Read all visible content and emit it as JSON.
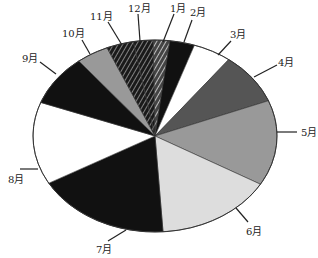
{
  "chart_data": {
    "type": "pie",
    "title": "",
    "legend": "none",
    "categories": [
      "1月",
      "2月",
      "3月",
      "4月",
      "5月",
      "6月",
      "7月",
      "8月",
      "9月",
      "10月",
      "11月",
      "12月"
    ],
    "values": [
      2.2,
      3.3,
      5.1,
      8.7,
      14.4,
      15.6,
      17.9,
      13.9,
      8.6,
      4.3,
      3.6,
      2.6
    ],
    "unit": "%",
    "start_angle_deg": -90.9,
    "direction": "clockwise",
    "fills": [
      "hatch-light",
      "#111111",
      "#ffffff",
      "#555555",
      "#999999",
      "#dddddd",
      "#111111",
      "#ffffff",
      "#111111",
      "#999999",
      "hatch-dark",
      "hatch-dark"
    ]
  },
  "geometry": {
    "cx": 155,
    "cy": 136,
    "rx": 122,
    "ry": 96
  },
  "labels": [
    {
      "text": "1月",
      "x": 170,
      "y": 12,
      "lx1": 174,
      "ly1": 14,
      "lx2": 163,
      "ly2": 42
    },
    {
      "text": "2月",
      "x": 190,
      "y": 16,
      "lx1": 192,
      "ly1": 20,
      "lx2": 184,
      "ly2": 42
    },
    {
      "text": "3月",
      "x": 230,
      "y": 38,
      "lx1": 231,
      "ly1": 41,
      "lx2": 218,
      "ly2": 55
    },
    {
      "text": "4月",
      "x": 278,
      "y": 66,
      "lx1": 277,
      "ly1": 65,
      "lx2": 254,
      "ly2": 77
    },
    {
      "text": "5月",
      "x": 301,
      "y": 136,
      "lx1": 297,
      "ly1": 132,
      "lx2": 277,
      "ly2": 132
    },
    {
      "text": "6月",
      "x": 246,
      "y": 235,
      "lx1": 248,
      "ly1": 222,
      "lx2": 236,
      "ly2": 208
    },
    {
      "text": "7月",
      "x": 96,
      "y": 253,
      "lx1": 108,
      "ly1": 241,
      "lx2": 126,
      "ly2": 230
    },
    {
      "text": "8月",
      "x": 8,
      "y": 183,
      "lx1": 20,
      "ly1": 169,
      "lx2": 38,
      "ly2": 169
    },
    {
      "text": "9月",
      "x": 22,
      "y": 62,
      "lx1": 40,
      "ly1": 62,
      "lx2": 56,
      "ly2": 74
    },
    {
      "text": "10月",
      "x": 62,
      "y": 37,
      "lx1": 82,
      "ly1": 40,
      "lx2": 90,
      "ly2": 54
    },
    {
      "text": "11月",
      "x": 90,
      "y": 20,
      "lx1": 108,
      "ly1": 22,
      "lx2": 122,
      "ly2": 45
    },
    {
      "text": "12月",
      "x": 128,
      "y": 12,
      "lx1": 138,
      "ly1": 14,
      "lx2": 140,
      "ly2": 41
    }
  ]
}
